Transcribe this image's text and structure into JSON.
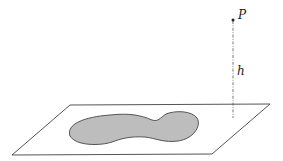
{
  "diagram": {
    "point_label": "P",
    "height_label": "h",
    "colors": {
      "line": "#555555",
      "region_fill": "#bdbdbd",
      "region_stroke": "#555555",
      "text": "#222222"
    }
  }
}
